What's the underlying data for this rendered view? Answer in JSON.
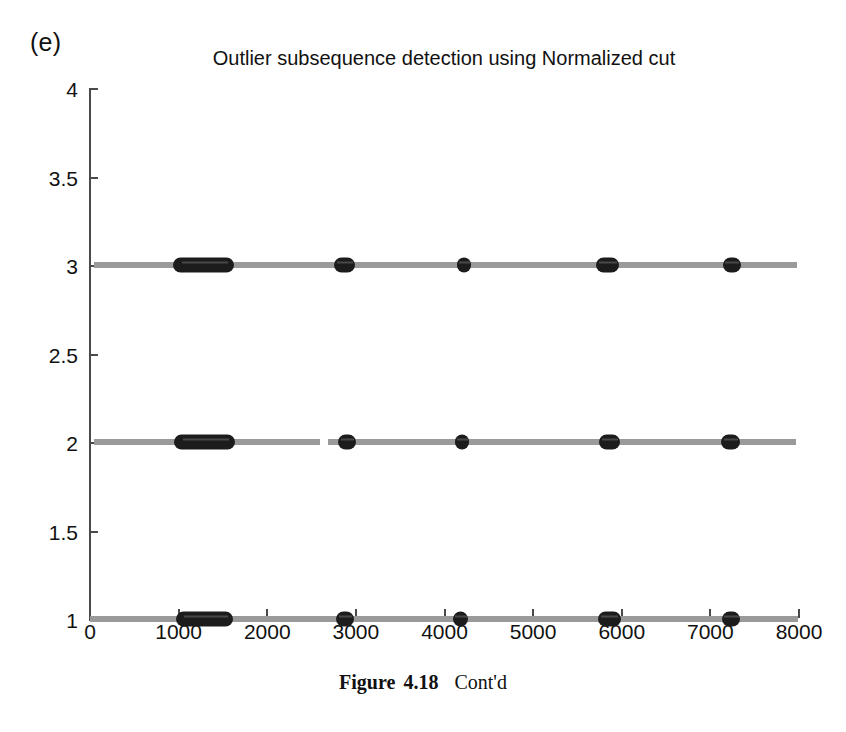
{
  "panel": {
    "letter": "(e)"
  },
  "caption": {
    "label": "Figure",
    "number": "4.18",
    "text": "Cont'd"
  },
  "chart_data": {
    "type": "scatter",
    "title": "Outlier subsequence detection using Normalized cut",
    "xlabel": "",
    "ylabel": "",
    "xlim": [
      0,
      8000
    ],
    "ylim": [
      1,
      4
    ],
    "grid": false,
    "legend": null,
    "xticks": [
      0,
      1000,
      2000,
      3000,
      4000,
      5000,
      6000,
      7000,
      8000
    ],
    "xtick_labels": [
      "0",
      "1000",
      "2000",
      "3000",
      "4000",
      "5000",
      "6000",
      "7000",
      "8000"
    ],
    "yticks": [
      1,
      1.5,
      2,
      2.5,
      3,
      3.5,
      4
    ],
    "ytick_labels": [
      "1",
      "1.5",
      "2",
      "2.5",
      "3",
      "3.5",
      "4"
    ],
    "line_color": "#9a9a9a",
    "marker_color": "#1c1c1c",
    "axis_color": "#4a4a4a",
    "series": [
      {
        "name": "row-3",
        "y": 3,
        "line_segments": [
          [
            60,
            7990
          ]
        ],
        "clusters": [
          [
            950,
            1640
          ],
          [
            2760,
            3000
          ],
          [
            4150,
            4310
          ],
          [
            5720,
            5980
          ],
          [
            7150,
            7360
          ]
        ]
      },
      {
        "name": "row-2",
        "y": 2,
        "line_segments": [
          [
            55,
            2610
          ],
          [
            2700,
            7980
          ]
        ],
        "clusters": [
          [
            960,
            1650
          ],
          [
            2810,
            3010
          ],
          [
            4130,
            4290
          ],
          [
            5750,
            5990
          ],
          [
            7130,
            7350
          ]
        ]
      },
      {
        "name": "row-1",
        "y": 1,
        "line_segments": [
          [
            10,
            8000
          ]
        ],
        "clusters": [
          [
            980,
            1630
          ],
          [
            2790,
            2990
          ],
          [
            4110,
            4280
          ],
          [
            5740,
            6000
          ],
          [
            7140,
            7350
          ]
        ]
      }
    ]
  }
}
